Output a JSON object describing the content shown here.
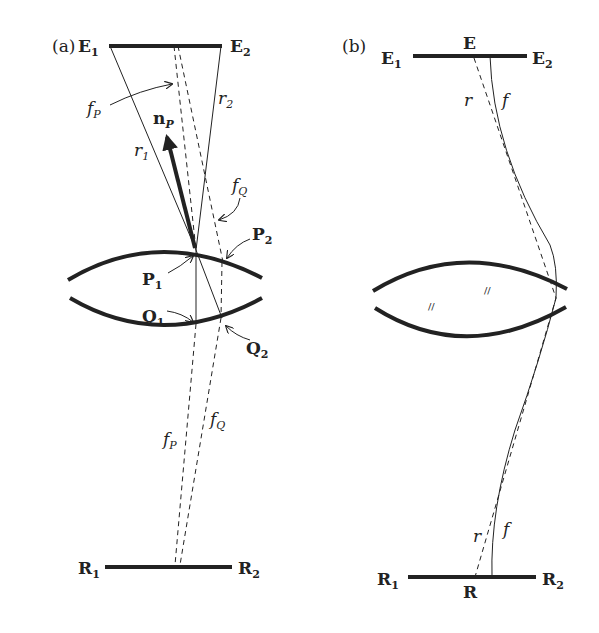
{
  "panel_a": {
    "label": "(a)",
    "top_plate": {
      "left": "E",
      "left_sub": "1",
      "right": "E",
      "right_sub": "2"
    },
    "bottom_plate": {
      "left": "R",
      "left_sub": "1",
      "right": "R",
      "right_sub": "2"
    },
    "rays": {
      "r1": {
        "main": "r",
        "sub": "1"
      },
      "r2": {
        "main": "r",
        "sub": "2"
      },
      "fP_top": {
        "main": "f",
        "sub": "P"
      },
      "fQ_top": {
        "main": "f",
        "sub": "Q"
      },
      "fP_bottom": {
        "main": "f",
        "sub": "P"
      },
      "fQ_bottom": {
        "main": "f",
        "sub": "Q"
      }
    },
    "normal": {
      "main": "n",
      "sub": "P"
    },
    "points": {
      "P1": {
        "main": "P",
        "sub": "1"
      },
      "P2": {
        "main": "P",
        "sub": "2"
      },
      "Q1": {
        "main": "Q",
        "sub": "1"
      },
      "Q2": {
        "main": "Q",
        "sub": "2"
      }
    }
  },
  "panel_b": {
    "label": "(b)",
    "top_plate": {
      "left": "E",
      "left_sub": "1",
      "center": "E",
      "right": "E",
      "right_sub": "2"
    },
    "bottom_plate": {
      "left": "R",
      "left_sub": "1",
      "center": "R",
      "right": "R",
      "right_sub": "2"
    },
    "rays": {
      "r_top": "r",
      "f_top": "f",
      "r_bottom": "r",
      "f_bottom": "f"
    },
    "lens_marks": [
      "//",
      "//"
    ]
  },
  "colors": {
    "ink": "#222222",
    "background": "#ffffff"
  }
}
